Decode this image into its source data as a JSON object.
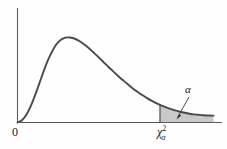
{
  "figure": {
    "name": "chi-square-distribution-tail-diagram",
    "background_color": "#fefefe",
    "curve_color": "#4a4a4a",
    "axis_color": "#5a5a5a",
    "shade_color": "#c9c9c9"
  },
  "labels": {
    "origin": "0",
    "alpha": "α",
    "critical_value_base": "χ",
    "critical_value_superscript": "2",
    "critical_value_subscript": "α"
  },
  "chart_data": {
    "type": "line",
    "title": "",
    "subtitle": "",
    "xlabel": "",
    "ylabel": "",
    "grid": false,
    "legend": null,
    "annotations": [
      {
        "name": "alpha-tail-area",
        "text": "α",
        "x": 190,
        "y": 90,
        "points_to_x": 177,
        "points_to_y": 117,
        "meaning": "upper tail area equals alpha"
      },
      {
        "name": "critical-value-tick",
        "text": "χ²α",
        "x": 168,
        "y": 133,
        "meaning": "chi-square critical value at axis position"
      },
      {
        "name": "origin-tick",
        "text": "0",
        "x": 17,
        "y": 131,
        "meaning": "origin of axes"
      }
    ],
    "axis_ranges": {
      "x": [
        0,
        1
      ],
      "y": [
        0,
        1
      ]
    },
    "shaded_region": {
      "name": "rejection-region",
      "from_x": 0.727,
      "to_x": 1.0,
      "label": "α",
      "fill": "#c9c9c9"
    },
    "critical_x_fraction": 0.727,
    "peak_x_fraction": 0.249,
    "peak_y_fraction": 0.859,
    "x": [
      0.0,
      0.024,
      0.049,
      0.073,
      0.098,
      0.122,
      0.146,
      0.171,
      0.195,
      0.22,
      0.244,
      0.268,
      0.293,
      0.317,
      0.341,
      0.366,
      0.39,
      0.415,
      0.439,
      0.463,
      0.488,
      0.512,
      0.537,
      0.561,
      0.585,
      0.61,
      0.634,
      0.659,
      0.683,
      0.707,
      0.727,
      0.756,
      0.78,
      0.805,
      0.829,
      0.854,
      0.878,
      0.902,
      0.927,
      0.951,
      0.976,
      1.0
    ],
    "y": [
      0.0,
      0.025,
      0.09,
      0.19,
      0.32,
      0.455,
      0.585,
      0.695,
      0.78,
      0.833,
      0.857,
      0.859,
      0.846,
      0.821,
      0.787,
      0.747,
      0.703,
      0.657,
      0.61,
      0.563,
      0.517,
      0.472,
      0.429,
      0.388,
      0.349,
      0.313,
      0.28,
      0.249,
      0.221,
      0.196,
      0.178,
      0.155,
      0.137,
      0.122,
      0.109,
      0.098,
      0.089,
      0.082,
      0.077,
      0.073,
      0.07,
      0.069
    ]
  }
}
